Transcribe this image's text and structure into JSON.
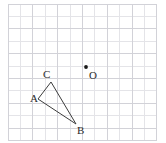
{
  "figure": {
    "width": 166,
    "height": 143,
    "background_color": "#ffffff",
    "grid": {
      "origin_x": 8,
      "origin_y": 4,
      "cell_size": 12.4,
      "columns": 12,
      "rows": 11,
      "minor_line_color": "#e4e4e8",
      "major_line_color": "#d2d2d8",
      "major_every": 2,
      "border_color": "#d2d2d8"
    },
    "stroke_color": "#3c3c3c",
    "stroke_width": 1,
    "point_color": "#1a1a1a"
  },
  "chart_data": {
    "type": "scatter",
    "title": "",
    "xlabel": "",
    "ylabel": "",
    "grid": true,
    "legend": "none",
    "axis_units": "grid cells",
    "xlim": [
      0,
      12
    ],
    "ylim": [
      0,
      11
    ],
    "points": [
      {
        "name": "A",
        "px": 38,
        "py": 99,
        "grid_x": 2.4,
        "grid_y": 3.1,
        "label": "A",
        "label_px": 30,
        "label_py": 93,
        "marker": "vertex"
      },
      {
        "name": "B",
        "px": 76,
        "py": 124,
        "grid_x": 5.5,
        "grid_y": 1.1,
        "label": "B",
        "label_px": 77,
        "label_py": 125,
        "marker": "vertex"
      },
      {
        "name": "C",
        "px": 51,
        "py": 82,
        "grid_x": 3.5,
        "grid_y": 4.5,
        "label": "C",
        "label_px": 43,
        "label_py": 69,
        "marker": "vertex"
      },
      {
        "name": "O",
        "px": 86,
        "py": 67,
        "grid_x": 6.3,
        "grid_y": 5.7,
        "label": "O",
        "label_px": 89,
        "label_py": 70,
        "marker": "dot"
      }
    ],
    "polygon": {
      "name": "triangle-ABC",
      "vertices": [
        "A",
        "C",
        "B"
      ],
      "closed": true,
      "filled": false
    }
  },
  "labels": {
    "a": "A",
    "b": "B",
    "c": "C",
    "o": "O"
  }
}
